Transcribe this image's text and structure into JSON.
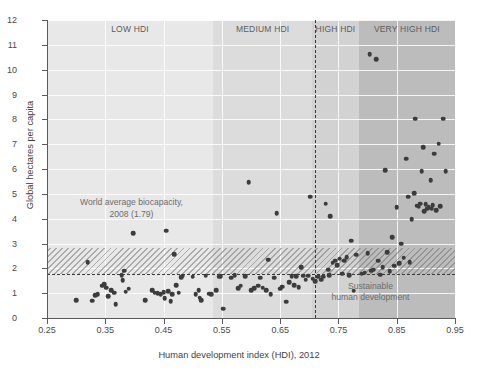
{
  "chart_data": {
    "type": "scatter",
    "title": "",
    "xlabel": "Human development index (HDI), 2012",
    "ylabel": "Global hectares per capita",
    "xlim": [
      0.25,
      0.95
    ],
    "ylim": [
      0,
      12
    ],
    "xticks": [
      "0.25",
      "0.35",
      "0.45",
      "0.55",
      "0.65",
      "0.75",
      "0.85",
      "0.95"
    ],
    "xtick_values": [
      0.25,
      0.35,
      0.45,
      0.55,
      0.65,
      0.75,
      0.85,
      0.95
    ],
    "yticks": [
      "0",
      "1",
      "2",
      "3",
      "4",
      "5",
      "6",
      "7",
      "8",
      "9",
      "10",
      "11",
      "12"
    ],
    "ytick_values": [
      0,
      1,
      2,
      3,
      4,
      5,
      6,
      7,
      8,
      9,
      10,
      11,
      12
    ],
    "grid": true,
    "legend": "none",
    "bands": [
      {
        "label": "LOW HDI",
        "x0": 0.25,
        "x1": 0.535,
        "color": "#e8e8e8"
      },
      {
        "label": "MEDIUM HDI",
        "x0": 0.535,
        "x1": 0.705,
        "color": "#dcdcdc"
      },
      {
        "label": "HIGH HDI",
        "x0": 0.705,
        "x1": 0.785,
        "color": "#d2d2d2"
      },
      {
        "label": "VERY HIGH HDI",
        "x0": 0.785,
        "x1": 0.95,
        "color": "#bcbcbc"
      }
    ],
    "annotations": [
      {
        "name": "world-average-biocapacity",
        "text": "World average biocapacity,\n2008 (1.79)",
        "x": 0.395,
        "y": 4.55
      },
      {
        "name": "sustainable-human-development",
        "text": "Sustainable\nhuman development",
        "x": 0.805,
        "y": 1.18
      }
    ],
    "reference_lines": [
      {
        "name": "biocapacity-line",
        "orientation": "horizontal",
        "value": 1.79,
        "style": "dashed"
      },
      {
        "name": "hdi-threshold-line",
        "orientation": "vertical",
        "value": 0.71,
        "style": "dashed"
      }
    ],
    "hatched_band": {
      "y0": 1.79,
      "y1": 2.82,
      "x0": 0.25,
      "x1": 0.95
    },
    "points": [
      [
        0.3,
        0.72
      ],
      [
        0.32,
        2.25
      ],
      [
        0.328,
        0.7
      ],
      [
        0.333,
        0.92
      ],
      [
        0.337,
        0.95
      ],
      [
        0.345,
        1.3
      ],
      [
        0.348,
        1.35
      ],
      [
        0.352,
        1.22
      ],
      [
        0.355,
        0.88
      ],
      [
        0.36,
        1.12
      ],
      [
        0.365,
        1.02
      ],
      [
        0.368,
        0.55
      ],
      [
        0.378,
        1.72
      ],
      [
        0.38,
        1.52
      ],
      [
        0.382,
        1.9
      ],
      [
        0.385,
        1.06
      ],
      [
        0.39,
        1.18
      ],
      [
        0.398,
        3.42
      ],
      [
        0.418,
        0.72
      ],
      [
        0.43,
        1.12
      ],
      [
        0.435,
        1.02
      ],
      [
        0.44,
        1.0
      ],
      [
        0.445,
        0.95
      ],
      [
        0.45,
        1.05
      ],
      [
        0.452,
        0.8
      ],
      [
        0.455,
        3.52
      ],
      [
        0.458,
        1.08
      ],
      [
        0.462,
        0.68
      ],
      [
        0.465,
        0.95
      ],
      [
        0.468,
        2.58
      ],
      [
        0.472,
        1.32
      ],
      [
        0.476,
        1.02
      ],
      [
        0.48,
        1.65
      ],
      [
        0.483,
        1.7
      ],
      [
        0.5,
        1.66
      ],
      [
        0.505,
        0.95
      ],
      [
        0.51,
        1.12
      ],
      [
        0.512,
        0.82
      ],
      [
        0.515,
        0.72
      ],
      [
        0.522,
        1.7
      ],
      [
        0.528,
        0.98
      ],
      [
        0.532,
        0.96
      ],
      [
        0.54,
        1.12
      ],
      [
        0.545,
        1.66
      ],
      [
        0.548,
        1.68
      ],
      [
        0.552,
        0.38
      ],
      [
        0.566,
        1.62
      ],
      [
        0.572,
        1.72
      ],
      [
        0.578,
        1.2
      ],
      [
        0.582,
        1.3
      ],
      [
        0.59,
        1.68
      ],
      [
        0.596,
        5.48
      ],
      [
        0.6,
        1.12
      ],
      [
        0.606,
        1.2
      ],
      [
        0.612,
        1.3
      ],
      [
        0.616,
        1.62
      ],
      [
        0.62,
        1.22
      ],
      [
        0.626,
        1.12
      ],
      [
        0.63,
        2.35
      ],
      [
        0.634,
        0.95
      ],
      [
        0.64,
        1.62
      ],
      [
        0.644,
        4.22
      ],
      [
        0.65,
        1.18
      ],
      [
        0.654,
        1.26
      ],
      [
        0.66,
        0.66
      ],
      [
        0.666,
        1.45
      ],
      [
        0.67,
        1.68
      ],
      [
        0.674,
        1.32
      ],
      [
        0.678,
        1.68
      ],
      [
        0.682,
        1.25
      ],
      [
        0.686,
        2.05
      ],
      [
        0.69,
        1.7
      ],
      [
        0.694,
        1.55
      ],
      [
        0.698,
        1.7
      ],
      [
        0.702,
        4.88
      ],
      [
        0.706,
        1.58
      ],
      [
        0.71,
        1.48
      ],
      [
        0.715,
        1.66
      ],
      [
        0.72,
        1.55
      ],
      [
        0.724,
        1.66
      ],
      [
        0.728,
        4.6
      ],
      [
        0.732,
        1.95
      ],
      [
        0.734,
        1.72
      ],
      [
        0.736,
        4.1
      ],
      [
        0.74,
        2.22
      ],
      [
        0.744,
        2.3
      ],
      [
        0.748,
        2.12
      ],
      [
        0.752,
        2.38
      ],
      [
        0.756,
        1.78
      ],
      [
        0.76,
        2.3
      ],
      [
        0.764,
        2.45
      ],
      [
        0.768,
        1.72
      ],
      [
        0.772,
        3.12
      ],
      [
        0.776,
        1.1
      ],
      [
        0.78,
        2.55
      ],
      [
        0.79,
        1.78
      ],
      [
        0.795,
        1.82
      ],
      [
        0.8,
        2.62
      ],
      [
        0.804,
        10.62
      ],
      [
        0.806,
        1.9
      ],
      [
        0.81,
        1.95
      ],
      [
        0.815,
        10.42
      ],
      [
        0.818,
        2.3
      ],
      [
        0.822,
        1.75
      ],
      [
        0.826,
        2.05
      ],
      [
        0.83,
        5.95
      ],
      [
        0.834,
        2.65
      ],
      [
        0.838,
        1.88
      ],
      [
        0.842,
        3.25
      ],
      [
        0.846,
        2.1
      ],
      [
        0.85,
        4.45
      ],
      [
        0.854,
        2.2
      ],
      [
        0.858,
        3.0
      ],
      [
        0.862,
        2.42
      ],
      [
        0.866,
        6.42
      ],
      [
        0.87,
        4.88
      ],
      [
        0.872,
        2.25
      ],
      [
        0.876,
        3.98
      ],
      [
        0.88,
        5.02
      ],
      [
        0.882,
        8.02
      ],
      [
        0.884,
        4.52
      ],
      [
        0.888,
        4.48
      ],
      [
        0.89,
        4.6
      ],
      [
        0.893,
        5.9
      ],
      [
        0.895,
        6.88
      ],
      [
        0.897,
        4.3
      ],
      [
        0.9,
        4.58
      ],
      [
        0.902,
        4.4
      ],
      [
        0.905,
        4.45
      ],
      [
        0.908,
        5.55
      ],
      [
        0.91,
        4.4
      ],
      [
        0.912,
        4.55
      ],
      [
        0.914,
        6.62
      ],
      [
        0.918,
        4.35
      ],
      [
        0.922,
        7.02
      ],
      [
        0.925,
        4.5
      ],
      [
        0.93,
        8.02
      ],
      [
        0.934,
        5.9
      ]
    ]
  }
}
